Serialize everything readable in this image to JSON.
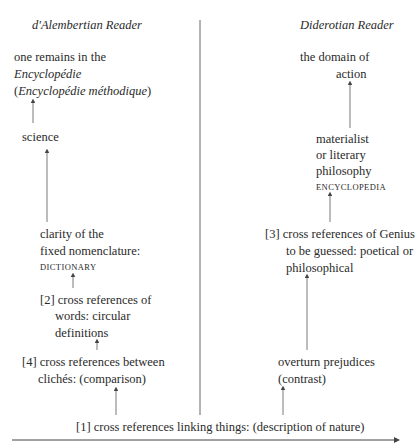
{
  "headers": {
    "left": "d'Alembertian Reader",
    "right": "Diderotian Reader"
  },
  "left_column": {
    "top": [
      "one remains in the",
      "Encyclopédie",
      "(",
      "Encyclopédie méthodique",
      ")"
    ],
    "science": "science",
    "clarity": [
      "clarity of the",
      "fixed nomenclature:"
    ],
    "clarity_tag": "DICTIONARY",
    "words": [
      "[2] cross references of",
      "words: circular",
      "definitions"
    ],
    "cliches": [
      "[4] cross references between",
      "clichés: (comparison)"
    ]
  },
  "right_column": {
    "top": [
      "the domain of",
      "action"
    ],
    "philosophy": [
      "materialist",
      "or literary",
      "philosophy"
    ],
    "philosophy_tag": "ENCYCLOPEDIA",
    "genius": [
      "[3] cross references of Genius",
      "to be guessed: poetical or",
      "philosophical"
    ],
    "prejudices": [
      "overturn prejudices",
      "(contrast)"
    ]
  },
  "bottom": {
    "base": "[1] cross references linking things: (description of nature)"
  },
  "colors": {
    "text": "#2a2a2a",
    "line": "#555555",
    "background": "#ffffff"
  }
}
